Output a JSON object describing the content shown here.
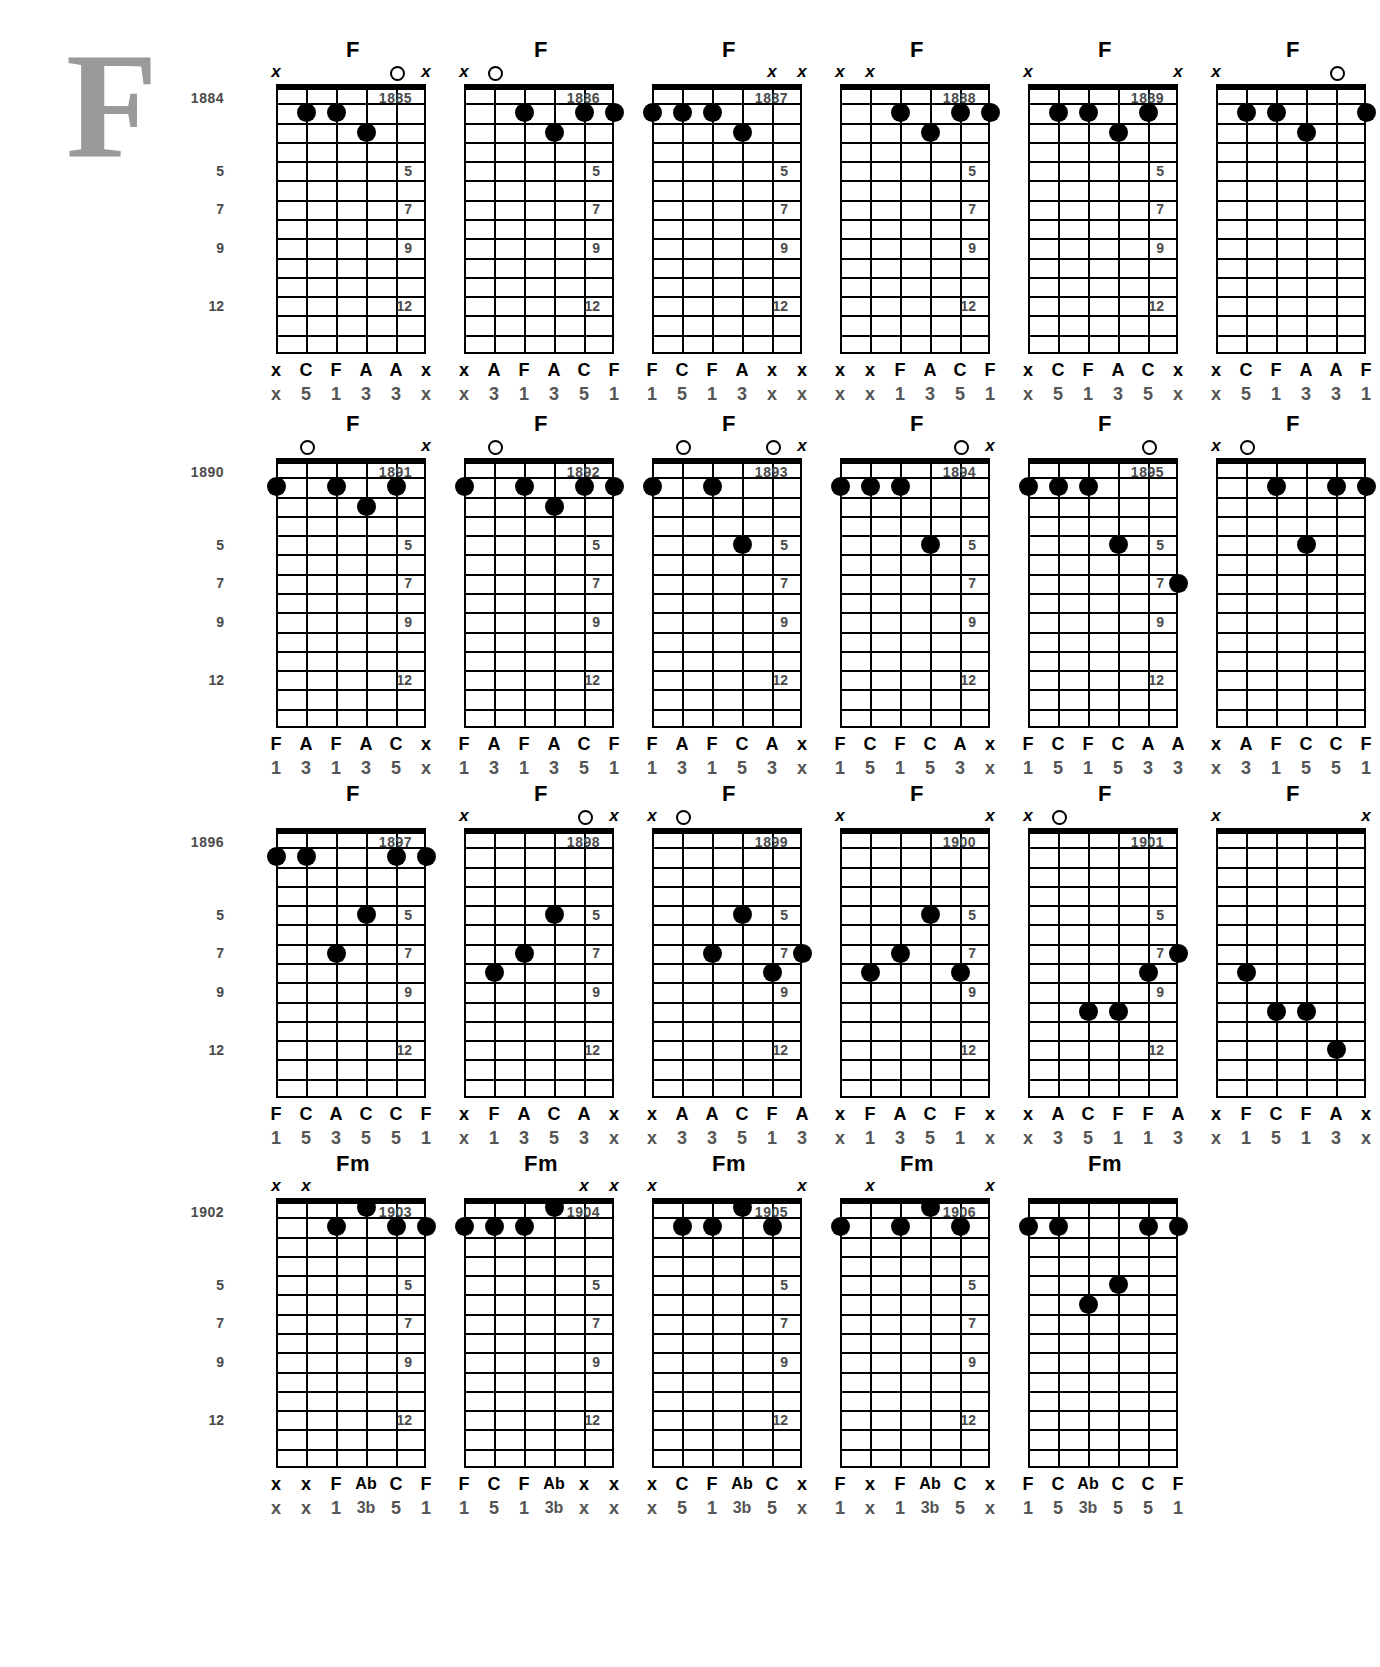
{
  "page": {
    "decorative_initial": "F",
    "fret_markers": [
      "5",
      "7",
      "9",
      "12"
    ],
    "string_count": 6,
    "fret_count": 14
  },
  "chords": [
    {
      "index": "1884",
      "name": "F",
      "markers": [
        "x",
        "",
        "",
        "",
        "o",
        "x"
      ],
      "dots": [
        [
          2,
          2
        ],
        [
          3,
          2
        ],
        [
          4,
          3
        ]
      ],
      "notes": [
        "x",
        "C",
        "F",
        "A",
        "A",
        "x"
      ],
      "degrees": [
        "x",
        "5",
        "1",
        "3",
        "3",
        "x"
      ]
    },
    {
      "index": "1885",
      "name": "F",
      "markers": [
        "x",
        "o",
        "",
        "",
        "",
        ""
      ],
      "dots": [
        [
          3,
          2
        ],
        [
          4,
          3
        ],
        [
          5,
          2
        ],
        [
          6,
          2
        ]
      ],
      "notes": [
        "x",
        "A",
        "F",
        "A",
        "C",
        "F"
      ],
      "degrees": [
        "x",
        "3",
        "1",
        "3",
        "5",
        "1"
      ]
    },
    {
      "index": "1886",
      "name": "F",
      "markers": [
        "",
        "",
        "",
        "",
        "x",
        "x"
      ],
      "dots": [
        [
          1,
          2
        ],
        [
          2,
          2
        ],
        [
          3,
          2
        ],
        [
          4,
          3
        ]
      ],
      "notes": [
        "F",
        "C",
        "F",
        "A",
        "x",
        "x"
      ],
      "degrees": [
        "1",
        "5",
        "1",
        "3",
        "x",
        "x"
      ]
    },
    {
      "index": "1887",
      "name": "F",
      "markers": [
        "x",
        "x",
        "",
        "",
        "",
        ""
      ],
      "dots": [
        [
          3,
          2
        ],
        [
          4,
          3
        ],
        [
          5,
          2
        ],
        [
          6,
          2
        ]
      ],
      "notes": [
        "x",
        "x",
        "F",
        "A",
        "C",
        "F"
      ],
      "degrees": [
        "x",
        "x",
        "1",
        "3",
        "5",
        "1"
      ]
    },
    {
      "index": "1888",
      "name": "F",
      "markers": [
        "x",
        "",
        "",
        "",
        "",
        "x"
      ],
      "dots": [
        [
          2,
          2
        ],
        [
          3,
          2
        ],
        [
          4,
          3
        ],
        [
          5,
          2
        ]
      ],
      "notes": [
        "x",
        "C",
        "F",
        "A",
        "C",
        "x"
      ],
      "degrees": [
        "x",
        "5",
        "1",
        "3",
        "5",
        "x"
      ]
    },
    {
      "index": "1889",
      "name": "F",
      "markers": [
        "x",
        "",
        "",
        "",
        "o",
        ""
      ],
      "dots": [
        [
          2,
          2
        ],
        [
          3,
          2
        ],
        [
          4,
          3
        ],
        [
          6,
          2
        ]
      ],
      "notes": [
        "x",
        "C",
        "F",
        "A",
        "A",
        "F"
      ],
      "degrees": [
        "x",
        "5",
        "1",
        "3",
        "3",
        "1"
      ]
    },
    {
      "index": "1890",
      "name": "F",
      "markers": [
        "",
        "o",
        "",
        "",
        "",
        "x"
      ],
      "dots": [
        [
          1,
          2
        ],
        [
          3,
          2
        ],
        [
          4,
          3
        ],
        [
          5,
          2
        ]
      ],
      "notes": [
        "F",
        "A",
        "F",
        "A",
        "C",
        "x"
      ],
      "degrees": [
        "1",
        "3",
        "1",
        "3",
        "5",
        "x"
      ]
    },
    {
      "index": "1891",
      "name": "F",
      "markers": [
        "",
        "o",
        "",
        "",
        "",
        ""
      ],
      "dots": [
        [
          1,
          2
        ],
        [
          3,
          2
        ],
        [
          4,
          3
        ],
        [
          5,
          2
        ],
        [
          6,
          2
        ]
      ],
      "notes": [
        "F",
        "A",
        "F",
        "A",
        "C",
        "F"
      ],
      "degrees": [
        "1",
        "3",
        "1",
        "3",
        "5",
        "1"
      ]
    },
    {
      "index": "1892",
      "name": "F",
      "markers": [
        "",
        "o",
        "",
        "",
        "o",
        "x"
      ],
      "dots": [
        [
          1,
          2
        ],
        [
          3,
          2
        ],
        [
          4,
          5
        ]
      ],
      "notes": [
        "F",
        "A",
        "F",
        "C",
        "A",
        "x"
      ],
      "degrees": [
        "1",
        "3",
        "1",
        "5",
        "3",
        "x"
      ]
    },
    {
      "index": "1893",
      "name": "F",
      "markers": [
        "",
        "",
        "",
        "",
        "o",
        "x"
      ],
      "dots": [
        [
          1,
          2
        ],
        [
          2,
          2
        ],
        [
          3,
          2
        ],
        [
          4,
          5
        ]
      ],
      "notes": [
        "F",
        "C",
        "F",
        "C",
        "A",
        "x"
      ],
      "degrees": [
        "1",
        "5",
        "1",
        "5",
        "3",
        "x"
      ]
    },
    {
      "index": "1894",
      "name": "F",
      "markers": [
        "",
        "",
        "",
        "",
        "o",
        ""
      ],
      "dots": [
        [
          1,
          2
        ],
        [
          2,
          2
        ],
        [
          3,
          2
        ],
        [
          4,
          5
        ],
        [
          6,
          7
        ]
      ],
      "notes": [
        "F",
        "C",
        "F",
        "C",
        "A",
        "A"
      ],
      "degrees": [
        "1",
        "5",
        "1",
        "5",
        "3",
        "3"
      ]
    },
    {
      "index": "1895",
      "name": "F",
      "markers": [
        "x",
        "o",
        "",
        "",
        "",
        ""
      ],
      "dots": [
        [
          3,
          2
        ],
        [
          4,
          5
        ],
        [
          5,
          2
        ],
        [
          6,
          2
        ]
      ],
      "notes": [
        "x",
        "A",
        "F",
        "C",
        "C",
        "F"
      ],
      "degrees": [
        "x",
        "3",
        "1",
        "5",
        "5",
        "1"
      ]
    },
    {
      "index": "1896",
      "name": "F",
      "markers": [
        "",
        "",
        "",
        "",
        "",
        ""
      ],
      "dots": [
        [
          1,
          2
        ],
        [
          2,
          2
        ],
        [
          3,
          7
        ],
        [
          4,
          5
        ],
        [
          5,
          2
        ],
        [
          6,
          2
        ]
      ],
      "notes": [
        "F",
        "C",
        "A",
        "C",
        "C",
        "F"
      ],
      "degrees": [
        "1",
        "5",
        "3",
        "5",
        "5",
        "1"
      ]
    },
    {
      "index": "1897",
      "name": "F",
      "markers": [
        "x",
        "",
        "",
        "",
        "o",
        "x"
      ],
      "dots": [
        [
          2,
          8
        ],
        [
          3,
          7
        ],
        [
          4,
          5
        ]
      ],
      "notes": [
        "x",
        "F",
        "A",
        "C",
        "A",
        "x"
      ],
      "degrees": [
        "x",
        "1",
        "3",
        "5",
        "3",
        "x"
      ]
    },
    {
      "index": "1898",
      "name": "F",
      "markers": [
        "x",
        "o",
        "",
        "",
        "",
        ""
      ],
      "dots": [
        [
          3,
          7
        ],
        [
          4,
          5
        ],
        [
          5,
          8
        ],
        [
          6,
          7
        ]
      ],
      "notes": [
        "x",
        "A",
        "A",
        "C",
        "F",
        "A"
      ],
      "degrees": [
        "x",
        "3",
        "3",
        "5",
        "1",
        "3"
      ]
    },
    {
      "index": "1899",
      "name": "F",
      "markers": [
        "x",
        "",
        "",
        "",
        "",
        "x"
      ],
      "dots": [
        [
          2,
          8
        ],
        [
          3,
          7
        ],
        [
          4,
          5
        ],
        [
          5,
          8
        ]
      ],
      "notes": [
        "x",
        "F",
        "A",
        "C",
        "F",
        "x"
      ],
      "degrees": [
        "x",
        "1",
        "3",
        "5",
        "1",
        "x"
      ]
    },
    {
      "index": "1900",
      "name": "F",
      "markers": [
        "x",
        "o",
        "",
        "",
        "",
        ""
      ],
      "dots": [
        [
          3,
          10
        ],
        [
          4,
          10
        ],
        [
          5,
          8
        ],
        [
          6,
          7
        ]
      ],
      "notes": [
        "x",
        "A",
        "C",
        "F",
        "F",
        "A"
      ],
      "degrees": [
        "x",
        "3",
        "5",
        "1",
        "1",
        "3"
      ]
    },
    {
      "index": "1901",
      "name": "F",
      "markers": [
        "x",
        "",
        "",
        "",
        "",
        "x"
      ],
      "dots": [
        [
          2,
          8
        ],
        [
          3,
          10
        ],
        [
          4,
          10
        ],
        [
          5,
          12
        ]
      ],
      "notes": [
        "x",
        "F",
        "C",
        "F",
        "A",
        "x"
      ],
      "degrees": [
        "x",
        "1",
        "5",
        "1",
        "3",
        "x"
      ]
    },
    {
      "index": "1902",
      "name": "Fm",
      "markers": [
        "x",
        "x",
        "",
        "",
        "",
        ""
      ],
      "dots": [
        [
          3,
          2
        ],
        [
          4,
          1
        ],
        [
          5,
          2
        ],
        [
          6,
          2
        ]
      ],
      "notes": [
        "x",
        "x",
        "F",
        "Ab",
        "C",
        "F"
      ],
      "degrees": [
        "x",
        "x",
        "1",
        "3b",
        "5",
        "1"
      ]
    },
    {
      "index": "1903",
      "name": "Fm",
      "markers": [
        "",
        "",
        "",
        "",
        "x",
        "x"
      ],
      "dots": [
        [
          1,
          2
        ],
        [
          2,
          2
        ],
        [
          3,
          2
        ],
        [
          4,
          1
        ]
      ],
      "notes": [
        "F",
        "C",
        "F",
        "Ab",
        "x",
        "x"
      ],
      "degrees": [
        "1",
        "5",
        "1",
        "3b",
        "x",
        "x"
      ]
    },
    {
      "index": "1904",
      "name": "Fm",
      "markers": [
        "x",
        "",
        "",
        "",
        "",
        "x"
      ],
      "dots": [
        [
          2,
          2
        ],
        [
          3,
          2
        ],
        [
          4,
          1
        ],
        [
          5,
          2
        ]
      ],
      "notes": [
        "x",
        "C",
        "F",
        "Ab",
        "C",
        "x"
      ],
      "degrees": [
        "x",
        "5",
        "1",
        "3b",
        "5",
        "x"
      ]
    },
    {
      "index": "1905",
      "name": "Fm",
      "markers": [
        "",
        "x",
        "",
        "",
        "",
        "x"
      ],
      "dots": [
        [
          1,
          2
        ],
        [
          3,
          2
        ],
        [
          4,
          1
        ],
        [
          5,
          2
        ]
      ],
      "notes": [
        "F",
        "x",
        "F",
        "Ab",
        "C",
        "x"
      ],
      "degrees": [
        "1",
        "x",
        "1",
        "3b",
        "5",
        "x"
      ]
    },
    {
      "index": "1906",
      "name": "Fm",
      "markers": [
        "",
        "",
        "",
        "",
        "",
        ""
      ],
      "dots": [
        [
          1,
          2
        ],
        [
          2,
          2
        ],
        [
          3,
          6
        ],
        [
          4,
          5
        ],
        [
          5,
          2
        ],
        [
          6,
          2
        ]
      ],
      "notes": [
        "F",
        "C",
        "Ab",
        "C",
        "C",
        "F"
      ],
      "degrees": [
        "1",
        "5",
        "3b",
        "5",
        "5",
        "1"
      ]
    }
  ]
}
